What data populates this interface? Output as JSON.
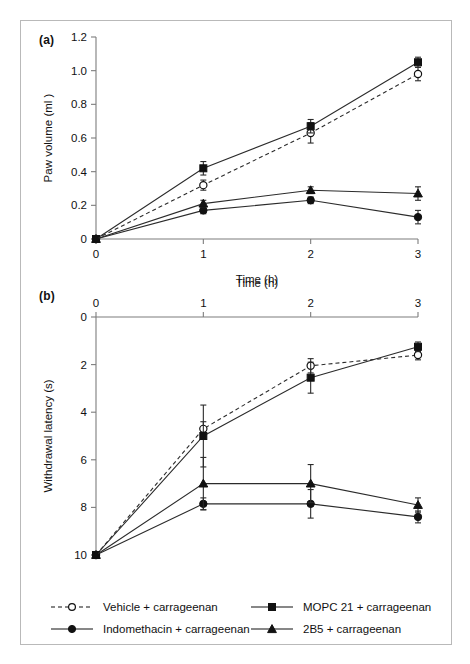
{
  "figure": {
    "panels": [
      {
        "tag": "(a)",
        "ylabel": "Paw volume (ml )",
        "xlabel": "Time (h)"
      },
      {
        "tag": "(b)",
        "ylabel": "Withdrawal latency (s)",
        "xlabel": "Time (h)"
      }
    ]
  },
  "legend": {
    "entries": [
      {
        "label": "Vehicle + carrageenan",
        "marker": "open-circle",
        "line": "dashed",
        "color": "#111111"
      },
      {
        "label": "Indomethacin + carrageenan",
        "marker": "filled-circle",
        "line": "solid",
        "color": "#111111"
      },
      {
        "label": "MOPC 21 + carrageenan",
        "marker": "filled-square",
        "line": "solid",
        "color": "#111111"
      },
      {
        "label": "2B5 + carrageenan",
        "marker": "filled-triangle",
        "line": "solid",
        "color": "#111111"
      }
    ]
  },
  "chart_data": [
    {
      "type": "line",
      "panel": "a",
      "title": "(a)",
      "xlabel": "Time (h)",
      "ylabel": "Paw volume (ml )",
      "x": [
        0,
        1,
        2,
        3
      ],
      "xticks": [
        0,
        1,
        2,
        3
      ],
      "xticklabels": [
        "0",
        "1",
        "2",
        "3"
      ],
      "xlim": [
        0,
        3
      ],
      "yticks": [
        0,
        0.2,
        0.4,
        0.6,
        0.8,
        1.0,
        1.2
      ],
      "yticklabels": [
        "0",
        "0.2",
        "0.4",
        "0.6",
        "0.8",
        "1.0",
        "1.2"
      ],
      "ylim": [
        0,
        1.2
      ],
      "y_inverted": false,
      "grid": false,
      "legend_position": "below-figure",
      "series": [
        {
          "name": "Vehicle + carrageenan",
          "marker": "open-circle",
          "line": "dashed",
          "values": [
            0,
            0.32,
            0.63,
            0.98
          ],
          "errors": [
            0,
            0.03,
            0.06,
            0.04
          ]
        },
        {
          "name": "Indomethacin + carrageenan",
          "marker": "filled-circle",
          "line": "solid",
          "values": [
            0,
            0.17,
            0.23,
            0.13
          ],
          "errors": [
            0,
            0.02,
            0.02,
            0.04
          ]
        },
        {
          "name": "MOPC 21 + carrageenan",
          "marker": "filled-square",
          "line": "solid",
          "values": [
            0,
            0.42,
            0.67,
            1.05
          ],
          "errors": [
            0,
            0.04,
            0.04,
            0.03
          ]
        },
        {
          "name": "2B5 + carrageenan",
          "marker": "filled-triangle",
          "line": "solid",
          "values": [
            0,
            0.21,
            0.29,
            0.27
          ],
          "errors": [
            0,
            0.02,
            0.02,
            0.04
          ]
        }
      ]
    },
    {
      "type": "line",
      "panel": "b",
      "title": "(b)",
      "xlabel": "Time (h)",
      "ylabel": "Withdrawal latency (s)",
      "x": [
        0,
        1,
        2,
        3
      ],
      "xticks": [
        0,
        1,
        2,
        3
      ],
      "xticklabels": [
        "0",
        "1",
        "2",
        "3"
      ],
      "xlim": [
        0,
        3
      ],
      "yticks": [
        0,
        2,
        4,
        6,
        8,
        10
      ],
      "yticklabels": [
        "0",
        "2",
        "4",
        "6",
        "8",
        "10"
      ],
      "ylim": [
        0,
        10
      ],
      "y_inverted": true,
      "grid": false,
      "legend_position": "below-figure",
      "series": [
        {
          "name": "Vehicle + carrageenan",
          "marker": "open-circle",
          "line": "dashed",
          "values": [
            10,
            4.7,
            2.05,
            1.6
          ],
          "errors": [
            0,
            0.3,
            0.3,
            0.2
          ]
        },
        {
          "name": "Indomethacin + carrageenan",
          "marker": "filled-circle",
          "line": "solid",
          "values": [
            10,
            7.85,
            7.85,
            8.4
          ],
          "errors": [
            0,
            0.25,
            0.6,
            0.25
          ]
        },
        {
          "name": "MOPC 21 + carrageenan",
          "marker": "filled-square",
          "line": "solid",
          "values": [
            10,
            5.0,
            2.55,
            1.25
          ],
          "errors": [
            0,
            1.3,
            0.65,
            0.2
          ]
        },
        {
          "name": "2B5 + carrageenan",
          "marker": "filled-triangle",
          "line": "solid",
          "values": [
            10,
            7.0,
            7.0,
            7.9
          ],
          "errors": [
            0,
            1.1,
            0.8,
            0.3
          ]
        }
      ]
    }
  ]
}
